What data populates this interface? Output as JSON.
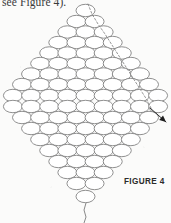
{
  "document": {
    "title": "Beadwork Instruction Figure",
    "body_text_fragment": "see Figure 4).",
    "figure_caption": "FIGURE 4"
  },
  "figure": {
    "name": "diamond-bead-weave-diagram",
    "colors": {
      "bead_outline": "#7c7c7c",
      "bead_fill": "#ffffff",
      "thread_dashed": "#8a8a8a",
      "arrow": "#1d1d1d",
      "page_background": "#fbfbfa",
      "text": "#3a3a3a",
      "caption_text": "#2b2b2b"
    },
    "bead": {
      "shape": "ellipse",
      "width_px": 19,
      "height_px": 12.4,
      "row_pitch_px": 11.2,
      "total_count": 81
    },
    "rows": [
      {
        "index": 1,
        "count": 1,
        "center_y": 10.5,
        "center_x": 85.5
      },
      {
        "index": 2,
        "count": 2,
        "center_y": 21.5,
        "center_x": 85.5
      },
      {
        "index": 3,
        "count": 3,
        "center_y": 32.0,
        "center_x": 85.5
      },
      {
        "index": 4,
        "count": 4,
        "center_y": 42.5,
        "center_x": 85.5
      },
      {
        "index": 5,
        "count": 5,
        "center_y": 53.0,
        "center_x": 85.5
      },
      {
        "index": 6,
        "count": 6,
        "center_y": 63.5,
        "center_x": 85.5
      },
      {
        "index": 7,
        "count": 7,
        "center_y": 74.0,
        "center_x": 85.5
      },
      {
        "index": 8,
        "count": 8,
        "center_y": 84.5,
        "center_x": 85.5
      },
      {
        "index": 9,
        "count": 9,
        "center_y": 95.5,
        "center_x": 85.5
      },
      {
        "index": 10,
        "count": 9,
        "center_y": 106.5,
        "center_x": 85.5
      },
      {
        "index": 11,
        "count": 8,
        "center_y": 117.5,
        "center_x": 85.5
      },
      {
        "index": 12,
        "count": 7,
        "center_y": 128.5,
        "center_x": 85.5
      },
      {
        "index": 13,
        "count": 6,
        "center_y": 139.5,
        "center_x": 85.5
      },
      {
        "index": 14,
        "count": 5,
        "center_y": 150.5,
        "center_x": 85.5
      },
      {
        "index": 15,
        "count": 4,
        "center_y": 161.5,
        "center_x": 85.5
      },
      {
        "index": 16,
        "count": 3,
        "center_y": 172.5,
        "center_x": 85.5
      },
      {
        "index": 17,
        "count": 2,
        "center_y": 183.5,
        "center_x": 85.5
      },
      {
        "index": 18,
        "count": 1,
        "center_y": 196.5,
        "center_x": 85.5
      }
    ],
    "thread_path": {
      "name": "dashed-thread-path",
      "style": "dashed",
      "dash_pattern": "2,2",
      "points": [
        [
          88,
          4
        ],
        [
          92,
          14
        ],
        [
          98,
          24
        ],
        [
          105,
          34
        ],
        [
          112,
          45
        ],
        [
          119,
          56
        ],
        [
          126,
          67
        ],
        [
          133,
          78
        ],
        [
          140,
          89
        ],
        [
          147,
          100
        ],
        [
          152,
          110
        ]
      ]
    },
    "exit_arrow": {
      "name": "thread-exit-arrow",
      "from": [
        150,
        108
      ],
      "to": [
        166,
        122
      ],
      "direction": "down-right"
    },
    "tail_thread": {
      "name": "bottom-thread-tail",
      "points": [
        [
          86,
          203
        ],
        [
          84,
          210
        ],
        [
          86,
          217
        ],
        [
          84,
          223
        ]
      ]
    }
  }
}
